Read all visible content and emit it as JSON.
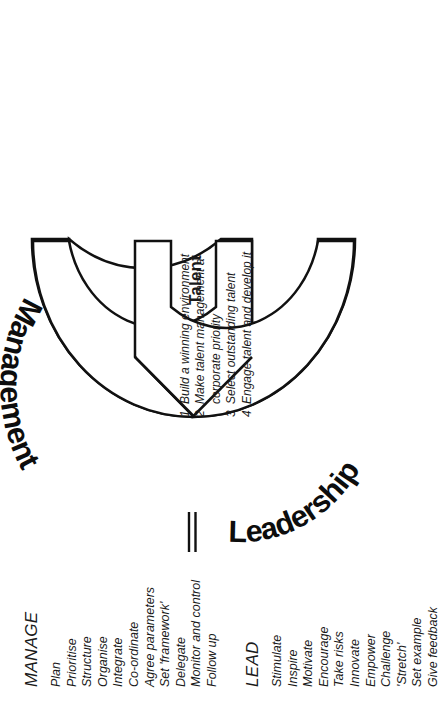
{
  "figure": {
    "band": {
      "segment_top_label": "Management",
      "segment_bottom_label": "Leadership",
      "fill_color": "#e9e9e9",
      "stroke_color": "#111111"
    },
    "center_label": "Talent",
    "arrow_fill": "#ffffff"
  },
  "lead": {
    "heading": "LEAD",
    "items": [
      "Stimulate",
      "Inspire",
      "Motivate",
      "Encourage",
      "Take risks",
      "Innovate",
      "Empower",
      "Challenge",
      "'Stretch'",
      "Set example",
      "Give feedback"
    ]
  },
  "manage": {
    "heading": "MANAGE",
    "items": [
      "Plan",
      "Prioritise",
      "Structure",
      "Organise",
      "Integrate",
      "Co-ordinate",
      "Agree parameters",
      "Set 'framework'",
      "Delegate",
      "Monitor and control",
      "Follow up"
    ]
  },
  "numbered_list": [
    {
      "num": "1",
      "line1": "Build a winning environment",
      "line2": ""
    },
    {
      "num": "2",
      "line1": "Make talent management a",
      "line2": "corporate priority"
    },
    {
      "num": "3",
      "line1": "Select outstanding talent",
      "line2": ""
    },
    {
      "num": "4",
      "line1": "Engage talent and develop it",
      "line2": ""
    }
  ],
  "caption": ""
}
